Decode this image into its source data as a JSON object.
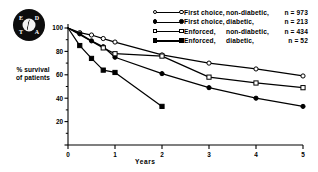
{
  "logo": {
    "name": "EDTA registry emblem",
    "letters": [
      "E",
      "D",
      "T",
      "A"
    ]
  },
  "axis": {
    "y_label_line1": "% survival",
    "y_label_line2": "of patients",
    "x_label": "Years",
    "y_ticks": [
      "0",
      "20",
      "40",
      "60",
      "80",
      "100"
    ],
    "x_ticks": [
      "0",
      "1",
      "2",
      "3",
      "4",
      "5"
    ]
  },
  "legend": [
    {
      "marker": "open-circle",
      "treatment": "First choice,",
      "group": "non-diabetic,",
      "n_label": "n = 973"
    },
    {
      "marker": "filled-circle",
      "treatment": "First choice,",
      "group": "diabetic,",
      "n_label": "n = 213"
    },
    {
      "marker": "open-square",
      "treatment": "Enforced,",
      "group": "non-diabetic,",
      "n_label": "n = 434"
    },
    {
      "marker": "filled-square",
      "treatment": "Enforced,",
      "group": "diabetic,",
      "n_label": "n =  52"
    }
  ],
  "chart_data": {
    "type": "line",
    "title": "",
    "xlabel": "Years",
    "ylabel": "% survival of patients",
    "xlim": [
      0,
      5
    ],
    "ylim": [
      0,
      100
    ],
    "xticks": [
      0,
      1,
      2,
      3,
      4,
      5
    ],
    "yticks": [
      0,
      20,
      40,
      60,
      80,
      100
    ],
    "grid": false,
    "legend_position": "top-right",
    "series": [
      {
        "name": "First choice, non-diabetic",
        "n": 973,
        "marker": "open-circle",
        "x": [
          0,
          0.25,
          0.5,
          0.75,
          1,
          2,
          3,
          4,
          5
        ],
        "y": [
          100,
          96,
          94,
          91,
          88,
          77,
          70,
          65,
          59
        ]
      },
      {
        "name": "First choice, diabetic",
        "n": 213,
        "marker": "filled-circle",
        "x": [
          0,
          0.25,
          0.5,
          0.75,
          1,
          2,
          3,
          4,
          5
        ],
        "y": [
          100,
          95,
          89,
          84,
          75,
          61,
          49,
          40,
          33
        ]
      },
      {
        "name": "Enforced, non-diabetic",
        "n": 434,
        "marker": "open-square",
        "x": [
          0,
          0.75,
          1,
          2,
          3,
          4,
          5
        ],
        "y": [
          100,
          83,
          78,
          76,
          58,
          53,
          49
        ]
      },
      {
        "name": "Enforced, diabetic",
        "n": 52,
        "marker": "filled-square",
        "x": [
          0,
          0.25,
          0.5,
          0.75,
          1,
          2
        ],
        "y": [
          100,
          85,
          74,
          64,
          62,
          33
        ]
      }
    ]
  }
}
